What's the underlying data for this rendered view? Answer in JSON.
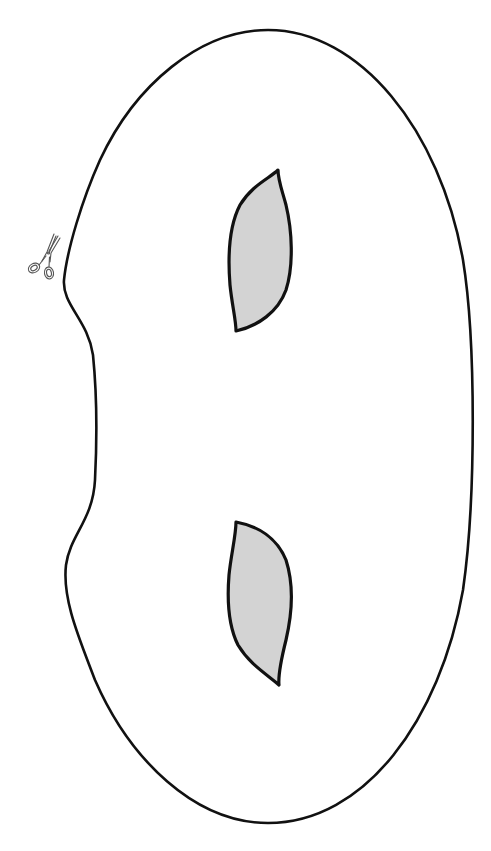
{
  "document": {
    "title": "Printable mask template",
    "type": "cut-out template"
  },
  "mask": {
    "label": "mask-outline",
    "outline_color": "#111111",
    "background_color": "#ffffff"
  },
  "eye_holes": [
    {
      "label": "left-eye-hole",
      "fill_color": "#d3d3d3",
      "stroke_color": "#111111"
    },
    {
      "label": "right-eye-hole",
      "fill_color": "#d3d3d3",
      "stroke_color": "#111111"
    }
  ],
  "cut_marker": {
    "icon": "scissors-icon",
    "meaning": "cut along the line",
    "color": "#555555"
  }
}
